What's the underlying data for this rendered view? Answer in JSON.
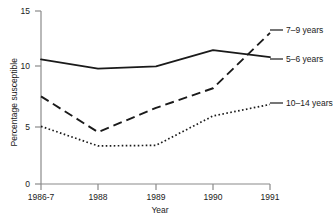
{
  "chart_data": {
    "type": "line",
    "title": "",
    "xlabel": "Year",
    "ylabel": "Percentage susceptible",
    "categories": [
      "1986-7",
      "1988",
      "1989",
      "1990",
      "1991"
    ],
    "ylim": [
      0,
      15
    ],
    "yticks": [
      0,
      5,
      10,
      15
    ],
    "grid": false,
    "legend_position": "right-inline",
    "series": [
      {
        "name": "5–6 years",
        "style": "solid",
        "values": [
          10.8,
          10.0,
          10.2,
          11.6,
          11.0
        ]
      },
      {
        "name": "7–9 years",
        "style": "dashed",
        "values": [
          7.6,
          4.5,
          6.6,
          8.3,
          13.1
        ]
      },
      {
        "name": "10–14 years",
        "style": "dotted",
        "values": [
          5.0,
          3.3,
          3.35,
          5.9,
          6.9
        ]
      }
    ]
  },
  "axis": {
    "y_title": "Percentage susceptible",
    "x_title": "Year",
    "y_tick_labels": [
      "15",
      "10",
      "5",
      "0"
    ],
    "x_tick_labels": [
      "1986-7",
      "1988",
      "1989",
      "1990",
      "1991"
    ]
  },
  "labels": {
    "series_7_9": "7–9 years",
    "series_5_6": "5–6 years",
    "series_10_14": "10–14 years"
  },
  "colors": {
    "axis": "#7a7a7a",
    "line": "#1a1a1a",
    "text": "#1a1a1a",
    "background": "#ffffff"
  }
}
